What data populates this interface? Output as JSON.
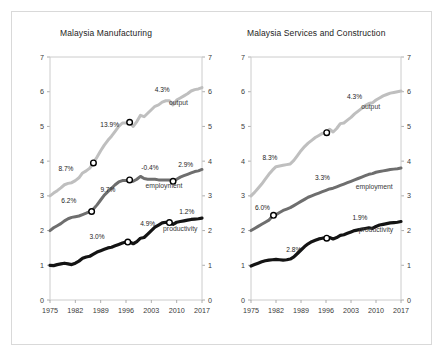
{
  "figure": {
    "background": "#ffffff",
    "frame_color": "#d9d9d9"
  },
  "chart_data": [
    {
      "type": "line",
      "title": "Malaysia Manufacturing",
      "xlabel": "",
      "ylabel": "",
      "xlim": [
        1975,
        2017
      ],
      "ylim": [
        0,
        7
      ],
      "yticks": [
        "0",
        "1",
        "2",
        "3",
        "4",
        "5",
        "6",
        "7"
      ],
      "ytick_values": [
        0,
        1,
        2,
        3,
        4,
        5,
        6,
        7
      ],
      "xticks": [
        "1975",
        "1982",
        "1989",
        "1996",
        "2003",
        "2010",
        "2017"
      ],
      "xtick_values": [
        1975,
        1982,
        1989,
        1996,
        2003,
        2010,
        2017
      ],
      "grid": false,
      "legend": "inline-right-of-series",
      "series": [
        {
          "name": "output",
          "label": "output",
          "color": "#bfbfbf",
          "width": 3.0,
          "x": [
            1975,
            1976,
            1977,
            1978,
            1979,
            1980,
            1981,
            1982,
            1983,
            1984,
            1985,
            1986,
            1987,
            1988,
            1989,
            1990,
            1991,
            1992,
            1993,
            1994,
            1995,
            1996,
            1997,
            1998,
            1999,
            2000,
            2001,
            2002,
            2003,
            2004,
            2005,
            2006,
            2007,
            2008,
            2009,
            2010,
            2011,
            2012,
            2013,
            2014,
            2015,
            2016,
            2017
          ],
          "y": [
            3.0,
            3.08,
            3.15,
            3.23,
            3.32,
            3.36,
            3.38,
            3.44,
            3.52,
            3.66,
            3.72,
            3.8,
            3.95,
            4.12,
            4.3,
            4.46,
            4.6,
            4.72,
            4.86,
            5.0,
            5.1,
            5.1,
            5.12,
            5.0,
            5.14,
            5.32,
            5.28,
            5.38,
            5.48,
            5.58,
            5.62,
            5.7,
            5.74,
            5.74,
            5.62,
            5.76,
            5.82,
            5.88,
            5.94,
            6.02,
            6.06,
            6.08,
            6.12
          ],
          "markers": [
            {
              "x": 1987,
              "y": 3.95
            },
            {
              "x": 1997,
              "y": 5.12
            }
          ],
          "annotations": [
            {
              "text": "8.7%",
              "x": 1979.4,
              "y": 3.72
            },
            {
              "text": "13.9%",
              "x": 1991.5,
              "y": 4.98
            },
            {
              "text": "4.3%",
              "x": 2006.0,
              "y": 6.0
            }
          ]
        },
        {
          "name": "employment",
          "label": "employment",
          "color": "#6e6e6e",
          "width": 3.0,
          "x": [
            1975,
            1976,
            1977,
            1978,
            1979,
            1980,
            1981,
            1982,
            1983,
            1984,
            1985,
            1986,
            1987,
            1988,
            1989,
            1990,
            1991,
            1992,
            1993,
            1994,
            1995,
            1996,
            1997,
            1998,
            1999,
            2000,
            2001,
            2002,
            2003,
            2004,
            2005,
            2006,
            2007,
            2008,
            2009,
            2010,
            2011,
            2012,
            2013,
            2014,
            2015,
            2016,
            2017
          ],
          "y": [
            2.0,
            2.08,
            2.14,
            2.2,
            2.28,
            2.34,
            2.38,
            2.4,
            2.42,
            2.46,
            2.5,
            2.55,
            2.62,
            2.74,
            2.88,
            3.02,
            3.12,
            3.22,
            3.32,
            3.4,
            3.44,
            3.44,
            3.46,
            3.42,
            3.48,
            3.56,
            3.5,
            3.48,
            3.48,
            3.48,
            3.46,
            3.46,
            3.46,
            3.46,
            3.42,
            3.48,
            3.54,
            3.58,
            3.62,
            3.66,
            3.7,
            3.72,
            3.76
          ],
          "markers": [
            {
              "x": 1986.5,
              "y": 2.55
            },
            {
              "x": 1997,
              "y": 3.46
            },
            {
              "x": 2009,
              "y": 3.42
            }
          ],
          "annotations": [
            {
              "text": "6.2%",
              "x": 1980.2,
              "y": 2.8
            },
            {
              "text": "9.7%",
              "x": 1991.0,
              "y": 3.12
            },
            {
              "text": "-0.4%",
              "x": 2002.6,
              "y": 3.74
            },
            {
              "text": "2.9%",
              "x": 2012.5,
              "y": 3.82
            }
          ]
        },
        {
          "name": "productivity",
          "label": "productivity",
          "color": "#141414",
          "width": 3.2,
          "x": [
            1975,
            1976,
            1977,
            1978,
            1979,
            1980,
            1981,
            1982,
            1983,
            1984,
            1985,
            1986,
            1987,
            1988,
            1989,
            1990,
            1991,
            1992,
            1993,
            1994,
            1995,
            1996,
            1997,
            1998,
            1999,
            2000,
            2001,
            2002,
            2003,
            2004,
            2005,
            2006,
            2007,
            2008,
            2009,
            2010,
            2011,
            2012,
            2013,
            2014,
            2015,
            2016,
            2017
          ],
          "y": [
            1.0,
            0.99,
            1.02,
            1.04,
            1.06,
            1.04,
            1.02,
            1.06,
            1.12,
            1.2,
            1.24,
            1.26,
            1.32,
            1.38,
            1.42,
            1.46,
            1.5,
            1.52,
            1.56,
            1.6,
            1.64,
            1.67,
            1.67,
            1.62,
            1.68,
            1.78,
            1.8,
            1.9,
            2.0,
            2.1,
            2.16,
            2.22,
            2.24,
            2.22,
            2.18,
            2.24,
            2.26,
            2.28,
            2.3,
            2.32,
            2.33,
            2.34,
            2.36
          ],
          "markers": [
            {
              "x": 1996.5,
              "y": 1.67
            },
            {
              "x": 2008.0,
              "y": 2.23
            }
          ],
          "annotations": [
            {
              "text": "3.0%",
              "x": 1988.0,
              "y": 1.76
            },
            {
              "text": "4.9%",
              "x": 2002.0,
              "y": 2.12
            },
            {
              "text": "1.2%",
              "x": 2012.8,
              "y": 2.48
            }
          ]
        }
      ]
    },
    {
      "type": "line",
      "title": "Malaysia Services and Construction",
      "xlabel": "",
      "ylabel": "",
      "xlim": [
        1975,
        2017
      ],
      "ylim": [
        0,
        7
      ],
      "yticks": [
        "0",
        "1",
        "2",
        "3",
        "4",
        "5",
        "6",
        "7"
      ],
      "ytick_values": [
        0,
        1,
        2,
        3,
        4,
        5,
        6,
        7
      ],
      "xticks": [
        "1975",
        "1982",
        "1989",
        "1996",
        "2003",
        "2010",
        "2017"
      ],
      "xtick_values": [
        1975,
        1982,
        1989,
        1996,
        2003,
        2010,
        2017
      ],
      "grid": false,
      "legend": "inline-right-of-series",
      "series": [
        {
          "name": "output",
          "label": "output",
          "color": "#bfbfbf",
          "width": 3.0,
          "x": [
            1975,
            1976,
            1977,
            1978,
            1979,
            1980,
            1981,
            1982,
            1983,
            1984,
            1985,
            1986,
            1987,
            1988,
            1989,
            1990,
            1991,
            1992,
            1993,
            1994,
            1995,
            1996,
            1997,
            1998,
            1999,
            2000,
            2001,
            2002,
            2003,
            2004,
            2005,
            2006,
            2007,
            2008,
            2009,
            2010,
            2011,
            2012,
            2013,
            2014,
            2015,
            2016,
            2017
          ],
          "y": [
            3.0,
            3.1,
            3.22,
            3.34,
            3.48,
            3.62,
            3.74,
            3.84,
            3.86,
            3.88,
            3.9,
            3.92,
            4.02,
            4.16,
            4.3,
            4.42,
            4.52,
            4.6,
            4.68,
            4.74,
            4.8,
            4.82,
            4.92,
            4.84,
            4.94,
            5.08,
            5.1,
            5.18,
            5.26,
            5.36,
            5.44,
            5.52,
            5.6,
            5.66,
            5.68,
            5.76,
            5.82,
            5.88,
            5.92,
            5.96,
            5.98,
            6.0,
            6.02
          ],
          "markers": [
            {
              "x": 1996.2,
              "y": 4.82
            }
          ],
          "annotations": [
            {
              "text": "8.3%",
              "x": 1980.3,
              "y": 4.04
            },
            {
              "text": "4.3%",
              "x": 2004.0,
              "y": 5.78
            }
          ]
        },
        {
          "name": "employment",
          "label": "employment",
          "color": "#6e6e6e",
          "width": 3.0,
          "x": [
            1975,
            1976,
            1977,
            1978,
            1979,
            1980,
            1981,
            1982,
            1983,
            1984,
            1985,
            1986,
            1987,
            1988,
            1989,
            1990,
            1991,
            1992,
            1993,
            1994,
            1995,
            1996,
            1997,
            1998,
            1999,
            2000,
            2001,
            2002,
            2003,
            2004,
            2005,
            2006,
            2007,
            2008,
            2009,
            2010,
            2011,
            2012,
            2013,
            2014,
            2015,
            2016,
            2017
          ],
          "y": [
            2.0,
            2.06,
            2.12,
            2.18,
            2.24,
            2.3,
            2.42,
            2.46,
            2.52,
            2.58,
            2.62,
            2.66,
            2.72,
            2.78,
            2.84,
            2.9,
            2.96,
            3.0,
            3.04,
            3.08,
            3.12,
            3.16,
            3.2,
            3.22,
            3.26,
            3.3,
            3.34,
            3.38,
            3.42,
            3.46,
            3.5,
            3.54,
            3.58,
            3.62,
            3.64,
            3.68,
            3.7,
            3.72,
            3.74,
            3.76,
            3.77,
            3.78,
            3.8
          ],
          "markers": [
            {
              "x": 1981.3,
              "y": 2.44
            }
          ],
          "annotations": [
            {
              "text": "6.0%",
              "x": 1978.2,
              "y": 2.6
            },
            {
              "text": "3.3%",
              "x": 1995.0,
              "y": 3.46
            }
          ]
        },
        {
          "name": "productivity",
          "label": "productivity",
          "color": "#141414",
          "width": 3.2,
          "x": [
            1975,
            1976,
            1977,
            1978,
            1979,
            1980,
            1981,
            1982,
            1983,
            1984,
            1985,
            1986,
            1987,
            1988,
            1989,
            1990,
            1991,
            1992,
            1993,
            1994,
            1995,
            1996,
            1997,
            1998,
            1999,
            2000,
            2001,
            2002,
            2003,
            2004,
            2005,
            2006,
            2007,
            2008,
            2009,
            2010,
            2011,
            2012,
            2013,
            2014,
            2015,
            2016,
            2017
          ],
          "y": [
            0.98,
            1.02,
            1.06,
            1.1,
            1.13,
            1.15,
            1.16,
            1.17,
            1.16,
            1.15,
            1.16,
            1.18,
            1.24,
            1.34,
            1.44,
            1.54,
            1.62,
            1.68,
            1.72,
            1.76,
            1.78,
            1.78,
            1.8,
            1.76,
            1.8,
            1.86,
            1.88,
            1.92,
            1.96,
            2.0,
            2.02,
            2.04,
            2.06,
            2.08,
            2.06,
            2.12,
            2.16,
            2.18,
            2.2,
            2.22,
            2.23,
            2.24,
            2.26
          ],
          "markers": [
            {
              "x": 1996.2,
              "y": 1.78
            }
          ],
          "annotations": [
            {
              "text": "2.8%",
              "x": 1987.0,
              "y": 1.38
            },
            {
              "text": "1.9%",
              "x": 2005.5,
              "y": 2.3
            }
          ]
        }
      ]
    }
  ]
}
